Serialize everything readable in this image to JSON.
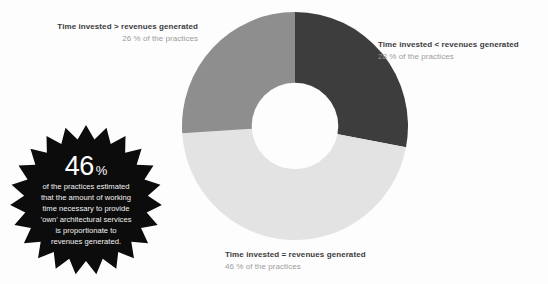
{
  "chart_data": {
    "type": "pie",
    "variant": "donut",
    "title": "",
    "categories": [
      "Time invested < revenues generated",
      "Time invested = revenues generated",
      "Time invested > revenues generated"
    ],
    "values": [
      28,
      46,
      26
    ],
    "value_unit": "% of the practices",
    "colors": [
      "#3d3d3d",
      "#e3e3e3",
      "#8e8e8e"
    ],
    "start_angle_deg": 0,
    "direction": "clockwise",
    "inner_radius_ratio": 0.38,
    "legend": "labels placed around the donut",
    "grid": false,
    "background": "#fdfdfd"
  },
  "donut": {
    "segments": [
      {
        "key": "less",
        "label": "Time invested < revenues generated",
        "sub": "28 % of the practices",
        "percent": 28,
        "color": "#3d3d3d"
      },
      {
        "key": "equal",
        "label": "Time invested = revenues generated",
        "sub": "46 % of the practices",
        "percent": 46,
        "color": "#e3e3e3"
      },
      {
        "key": "greater",
        "label": "Time invested > revenues generated",
        "sub": "26 % of the practices",
        "percent": 26,
        "color": "#8e8e8e"
      }
    ]
  },
  "badge": {
    "number": "46",
    "percent_symbol": "%",
    "lines": [
      "of the practices estimated",
      "that the amount of working",
      "time necessary to provide",
      "’own’ architectural services",
      "is proportionate to",
      "revenues generated."
    ],
    "fill": "#0c0c0c",
    "text_color": "#ffffff"
  },
  "theme": {
    "background": "#fdfdfd",
    "title_color": "#3c3c3c",
    "sub_color": "#9c9c9c"
  }
}
